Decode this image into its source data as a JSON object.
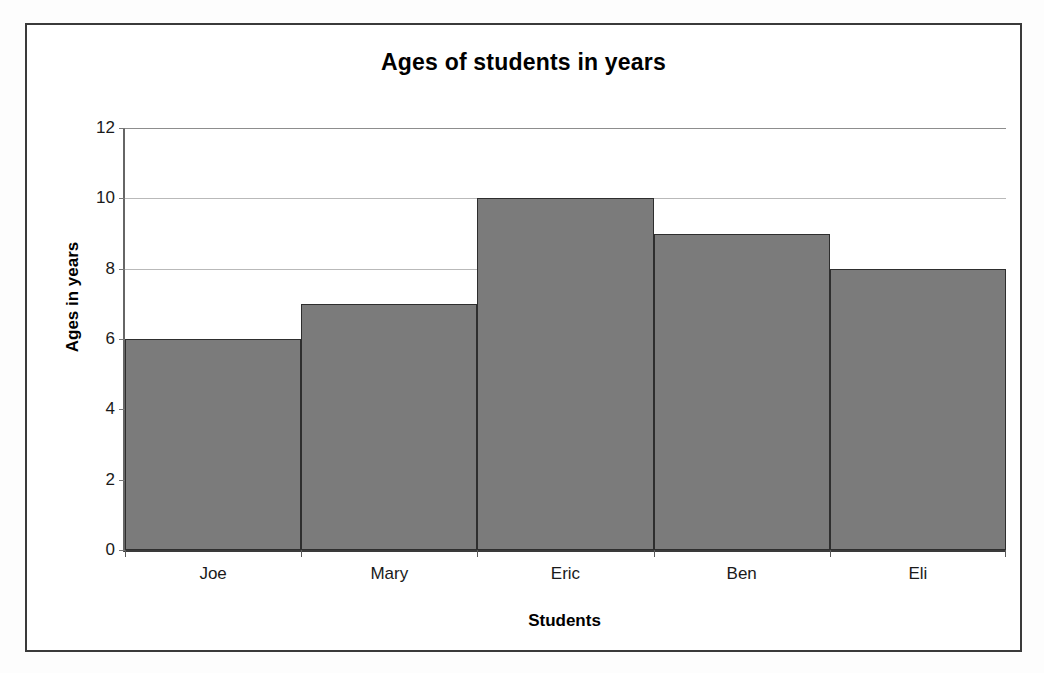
{
  "chart_data": {
    "type": "bar",
    "title": "Ages of students in years",
    "xlabel": "Students",
    "ylabel": "Ages in years",
    "categories": [
      "Joe",
      "Mary",
      "Eric",
      "Ben",
      "Eli"
    ],
    "values": [
      6,
      7,
      10,
      9,
      8
    ],
    "yticks": [
      0,
      2,
      4,
      6,
      8,
      10,
      12
    ],
    "ytick_labels": [
      "0",
      "2",
      "4",
      "6",
      "8",
      "10",
      "12"
    ],
    "ylim": [
      0,
      12
    ],
    "grid": "horizontal",
    "legend": "none",
    "bar_gap": "none",
    "colors": {
      "bar_fill": "#7b7b7b",
      "bar_outline": "#2e2e2e",
      "gridline": "#b9b9b9",
      "axis": "#3a3a3a",
      "frame": "#3a3a3a",
      "text": "#000000",
      "plot_background": "#ffffff"
    }
  }
}
